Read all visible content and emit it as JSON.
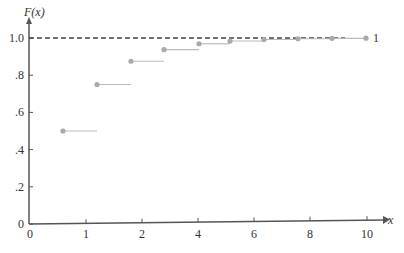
{
  "chart_data": {
    "type": "step",
    "title": "",
    "ylabel": "F(x)",
    "xlabel": "x",
    "x_tick_labels": [
      "0",
      "1",
      "2",
      "4",
      "6",
      "8",
      "10"
    ],
    "x_tick_px": [
      30,
      86,
      142,
      198,
      254,
      310,
      367
    ],
    "y_tick_labels": [
      "0",
      ".2",
      ".4",
      ".6",
      ".8",
      "1.0"
    ],
    "y_tick_values": [
      0,
      0.2,
      0.4,
      0.6,
      0.8,
      1.0
    ],
    "ylim": [
      0,
      1.0
    ],
    "reference_line": {
      "y": 1.0,
      "style": "dashed",
      "label": "1"
    },
    "series": [
      {
        "name": "F(x)",
        "points": [
          {
            "x": 1,
            "y": 0.5
          },
          {
            "x": 2,
            "y": 0.75
          },
          {
            "x": 3,
            "y": 0.875
          },
          {
            "x": 4,
            "y": 0.9375
          },
          {
            "x": 5,
            "y": 0.969
          },
          {
            "x": 6,
            "y": 0.984
          },
          {
            "x": 7,
            "y": 0.992
          },
          {
            "x": 8,
            "y": 0.996
          },
          {
            "x": 9,
            "y": 0.998
          },
          {
            "x": 10,
            "y": 0.999
          }
        ],
        "points_px": [
          63,
          97,
          131,
          164,
          199,
          230,
          264,
          298,
          332,
          366
        ]
      }
    ],
    "grid": false,
    "legend": null
  },
  "labels": {
    "y_axis_title": "F(x)",
    "x_axis_title": "x",
    "ref_label": "1"
  },
  "colors": {
    "axis": "#555555",
    "dashed": "#444444",
    "point": "#aaaaaa",
    "segment": "#bbbbbb"
  }
}
